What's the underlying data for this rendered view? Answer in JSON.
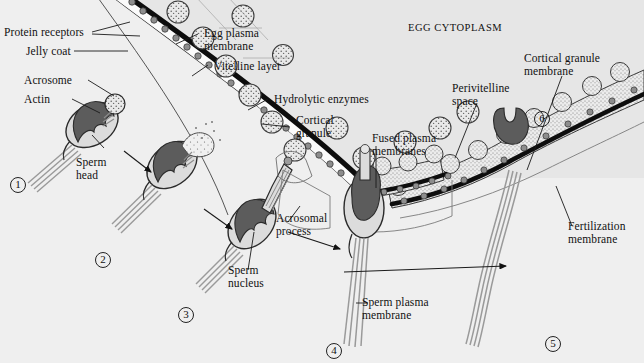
{
  "figure": {
    "background_color": "#efefef",
    "ink_color": "#111111",
    "sperm_nucleus_color": "#5c5c5c",
    "sperm_cytoplasm_color": "#d8d8d8",
    "egg_cytoplasm_color": "#e4e4e4",
    "granule_fill_color": "#e8e8e8",
    "receptor_dot_color": "#8a8a8a",
    "membrane_color": "#0d0d0d"
  },
  "labels": {
    "protein_receptors": "Protein receptors",
    "jelly_coat": "Jelly coat",
    "acrosome": "Acrosome",
    "actin": "Actin",
    "sperm_head": "Sperm\nhead",
    "egg_plasma_membrane": "Egg plasma\nmembrane",
    "vitelline_layer": "Vitelline layer",
    "hydrolytic_enzymes": "Hydrolytic enzymes",
    "cortical_granule": "Cortical\ngranule",
    "egg_cytoplasm": "Egg cytoplasm",
    "perivitelline_space": "Perivitelline\nspace",
    "cortical_granule_membrane": "Cortical granule\nmembrane",
    "fused_plasma_membranes": "Fused plasma\nmembranes",
    "acrosomal_process": "Acrosomal\nprocess",
    "sperm_nucleus": "Sperm\nnucleus",
    "sperm_plasma_membrane": "Sperm plasma\nmembrane",
    "fertilization_membrane": "Fertilization\nmembrane"
  },
  "steps": [
    {
      "id": "step-1",
      "number": "1"
    },
    {
      "id": "step-2",
      "number": "2"
    },
    {
      "id": "step-3",
      "number": "3"
    },
    {
      "id": "step-4",
      "number": "4"
    },
    {
      "id": "step-5",
      "number": "5"
    },
    {
      "id": "step-6",
      "number": "6"
    }
  ]
}
